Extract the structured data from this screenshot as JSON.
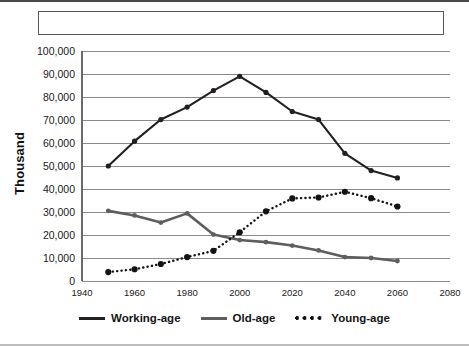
{
  "figure": {
    "title_box_text": "",
    "y_axis_title": "Thousand"
  },
  "legend": {
    "position": "bottom-center",
    "items": [
      {
        "label": "Working-age",
        "marker": "solid-line-dark",
        "color": "#231f1e"
      },
      {
        "label": "Old-age",
        "marker": "solid-line-gray",
        "color": "#5e5e5e"
      },
      {
        "label": "Young-age",
        "marker": "dotted-line",
        "color": "#16120f"
      }
    ]
  },
  "chart_data": {
    "type": "line",
    "title": "",
    "xlabel": "",
    "ylabel": "Thousand",
    "xlim": [
      1940,
      2080
    ],
    "ylim": [
      0,
      100000
    ],
    "grid": true,
    "x_ticks": [
      1940,
      1960,
      1980,
      2000,
      2020,
      2040,
      2060,
      2080
    ],
    "x_tick_labels": [
      "1940",
      "1960",
      "1980",
      "2000",
      "2020",
      "2040",
      "2060",
      "2080"
    ],
    "y_ticks": [
      0,
      10000,
      20000,
      30000,
      40000,
      50000,
      60000,
      70000,
      80000,
      90000,
      100000
    ],
    "y_tick_labels": [
      "0",
      "10,000",
      "20,000",
      "30,000",
      "40,000",
      "50,000",
      "60,000",
      "70,000",
      "80,000",
      "90,000",
      "100,000"
    ],
    "x": [
      1950,
      1960,
      1970,
      1980,
      1990,
      2000,
      2010,
      2020,
      2030,
      2040,
      2050,
      2060
    ],
    "series": [
      {
        "name": "Working-age",
        "style": "solid",
        "color": "#231f1e",
        "values": [
          50000,
          60800,
          70200,
          75600,
          82800,
          89000,
          82000,
          73700,
          70200,
          55500,
          48000,
          44800
        ]
      },
      {
        "name": "Old-age",
        "style": "solid",
        "color": "#5e5e5e",
        "values": [
          30500,
          28500,
          25400,
          29400,
          20200,
          17800,
          16900,
          15400,
          13300,
          10400,
          10000,
          8700
        ]
      },
      {
        "name": "Young-age",
        "style": "dotted",
        "color": "#16120f",
        "values": [
          3900,
          5100,
          7400,
          10400,
          13100,
          21200,
          30300,
          35900,
          36300,
          38800,
          36000,
          32400
        ]
      }
    ]
  }
}
